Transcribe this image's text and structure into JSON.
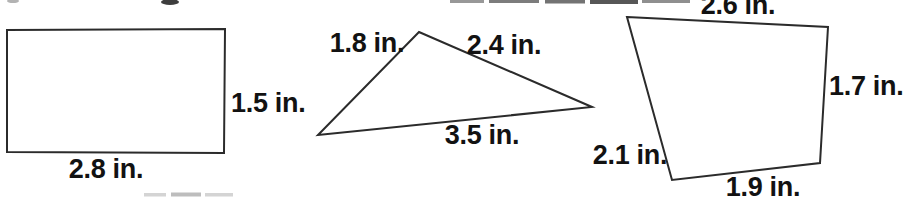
{
  "page": {
    "background": "#ffffff",
    "line_color": "#2b2b2b",
    "text_color": "#121212"
  },
  "figure": {
    "unit": "in.",
    "shapes": [
      {
        "id": "rectangle",
        "type": "rectangle",
        "sides": {
          "right": "1.5 in.",
          "bottom": "2.8 in."
        }
      },
      {
        "id": "triangle",
        "type": "triangle",
        "sides": {
          "top_left": "1.8 in.",
          "top_right": "2.4 in.",
          "bottom": "3.5 in."
        }
      },
      {
        "id": "quadrilateral",
        "type": "quadrilateral",
        "sides": {
          "top": "2.6 in.",
          "right": "1.7 in.",
          "bottom_left": "2.1 in.",
          "bottom": "1.9 in."
        }
      }
    ]
  }
}
